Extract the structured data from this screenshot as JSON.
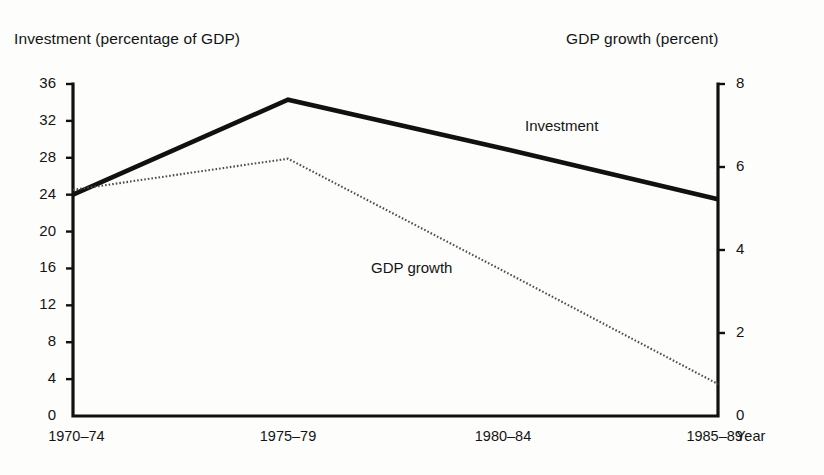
{
  "chart_data": {
    "type": "line",
    "title": "",
    "categories": [
      "1970–74",
      "1975–79",
      "1980–84",
      "1985–89"
    ],
    "xlabel": "Year",
    "grid": false,
    "legend_position": "inline-annotation",
    "axes": {
      "left": {
        "label": "Investment (percentage of GDP)",
        "ticks": [
          0,
          4,
          8,
          12,
          16,
          20,
          24,
          28,
          32,
          36
        ],
        "tick_labels": [
          "0",
          "4",
          "8",
          "12",
          "16",
          "20",
          "24",
          "28",
          "32",
          "36"
        ],
        "ylim": [
          0,
          36
        ]
      },
      "right": {
        "label": "GDP growth (percent)",
        "ticks": [
          0,
          2,
          4,
          6,
          8
        ],
        "tick_labels": [
          "0",
          "2",
          "4",
          "6",
          "8"
        ],
        "ylim": [
          0,
          8
        ]
      }
    },
    "series": [
      {
        "name": "Investment",
        "axis": "left",
        "style": "solid-thick",
        "color": "#111111",
        "values": [
          24.0,
          34.3,
          29.0,
          23.5
        ]
      },
      {
        "name": "GDP growth",
        "axis": "right",
        "style": "dotted",
        "color": "#555555",
        "values": [
          5.45,
          6.2,
          3.5,
          0.77
        ]
      }
    ],
    "annotations": [
      {
        "name": "investment-label",
        "text": "Investment"
      },
      {
        "name": "gdp-growth-label",
        "text": "GDP growth"
      }
    ]
  },
  "xaxis_end_label": "Year"
}
